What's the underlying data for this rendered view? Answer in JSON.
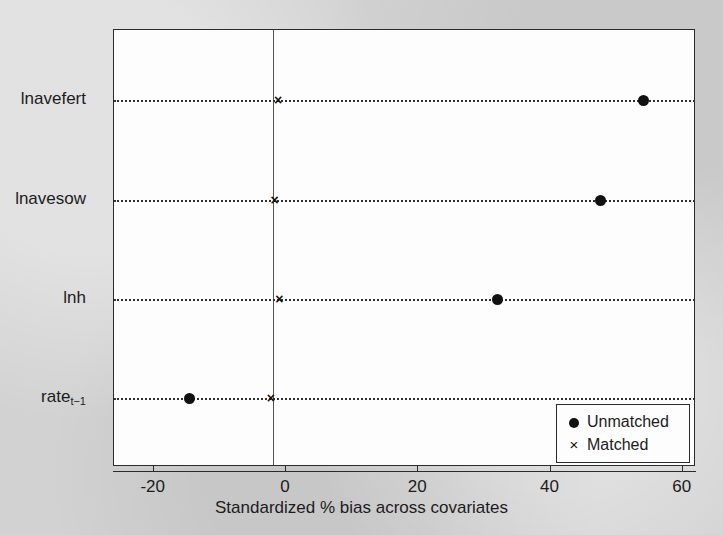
{
  "chart_data": {
    "type": "scatter",
    "title": "",
    "xlabel": "Standardized % bias across covariates",
    "ylabel": "",
    "xlim": [
      -26,
      62
    ],
    "xticks": [
      -20,
      0,
      20,
      40,
      60
    ],
    "xticklabels": [
      "-20",
      "0",
      "20",
      "40",
      "60"
    ],
    "grid": "dotted horizontal guides per category",
    "zero_line": true,
    "legend_position": "lower right",
    "categories": [
      "lnavefert",
      "lnavesow",
      "lnh",
      "rate"
    ],
    "category_labels": [
      {
        "text": "lnavefert",
        "sub": ""
      },
      {
        "text": "lnavesow",
        "sub": ""
      },
      {
        "text": "lnh",
        "sub": ""
      },
      {
        "text": "rate",
        "sub": "t−1"
      }
    ],
    "series": [
      {
        "name": "Unmatched",
        "marker": "filled-circle",
        "color": "#111111",
        "values": [
          54.0,
          47.6,
          32.0,
          -14.6
        ]
      },
      {
        "name": "Matched",
        "marker": "x",
        "color": "#111111",
        "values": [
          -1.2,
          -1.7,
          -1.0,
          -2.3
        ]
      }
    ]
  },
  "legend": {
    "entries": [
      {
        "symbol": "filled-circle",
        "label": "Unmatched"
      },
      {
        "symbol": "x",
        "label": "Matched"
      }
    ]
  },
  "colors": {
    "page_background": "#d2d2d2",
    "panel_background": "#fdfdfd",
    "axis": "#2b2b2b",
    "marker": "#111111",
    "guide": "#2f2f2f"
  }
}
